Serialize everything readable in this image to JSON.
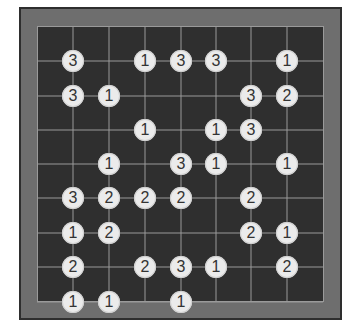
{
  "puzzle": {
    "type": "hashi-bridges",
    "grid": {
      "cols": 7,
      "rows": 8,
      "col_x": [
        73,
        109,
        145,
        181,
        216,
        251,
        287
      ],
      "row_y": [
        61,
        96,
        130,
        164,
        198,
        233,
        267,
        302
      ],
      "border": {
        "left": 37,
        "right": 323,
        "top": 26,
        "bottom": 302
      }
    },
    "colors": {
      "page_bg": "#ffffff",
      "frame": "#6e6e6e",
      "frame_border": "#2e2e2e",
      "board": "#2f2f2f",
      "grid_line": "#9a9a9a",
      "island_fill": "#ebebeb",
      "island_text": "#333333"
    },
    "islands": [
      {
        "row": 0,
        "col": 0,
        "value": "3"
      },
      {
        "row": 0,
        "col": 2,
        "value": "1"
      },
      {
        "row": 0,
        "col": 3,
        "value": "3"
      },
      {
        "row": 0,
        "col": 4,
        "value": "3"
      },
      {
        "row": 0,
        "col": 6,
        "value": "1"
      },
      {
        "row": 1,
        "col": 0,
        "value": "3"
      },
      {
        "row": 1,
        "col": 1,
        "value": "1"
      },
      {
        "row": 1,
        "col": 5,
        "value": "3"
      },
      {
        "row": 1,
        "col": 6,
        "value": "2"
      },
      {
        "row": 2,
        "col": 2,
        "value": "1"
      },
      {
        "row": 2,
        "col": 4,
        "value": "1"
      },
      {
        "row": 2,
        "col": 5,
        "value": "3"
      },
      {
        "row": 3,
        "col": 1,
        "value": "1"
      },
      {
        "row": 3,
        "col": 3,
        "value": "3"
      },
      {
        "row": 3,
        "col": 4,
        "value": "1"
      },
      {
        "row": 3,
        "col": 6,
        "value": "1"
      },
      {
        "row": 4,
        "col": 0,
        "value": "3"
      },
      {
        "row": 4,
        "col": 1,
        "value": "2"
      },
      {
        "row": 4,
        "col": 2,
        "value": "2"
      },
      {
        "row": 4,
        "col": 3,
        "value": "2"
      },
      {
        "row": 4,
        "col": 5,
        "value": "2"
      },
      {
        "row": 5,
        "col": 0,
        "value": "1"
      },
      {
        "row": 5,
        "col": 1,
        "value": "2"
      },
      {
        "row": 5,
        "col": 5,
        "value": "2"
      },
      {
        "row": 5,
        "col": 6,
        "value": "1"
      },
      {
        "row": 6,
        "col": 0,
        "value": "2"
      },
      {
        "row": 6,
        "col": 2,
        "value": "2"
      },
      {
        "row": 6,
        "col": 3,
        "value": "3"
      },
      {
        "row": 6,
        "col": 4,
        "value": "1"
      },
      {
        "row": 6,
        "col": 6,
        "value": "2"
      },
      {
        "row": 7,
        "col": 0,
        "value": "1"
      },
      {
        "row": 7,
        "col": 1,
        "value": "1"
      },
      {
        "row": 7,
        "col": 3,
        "value": "1"
      }
    ]
  }
}
